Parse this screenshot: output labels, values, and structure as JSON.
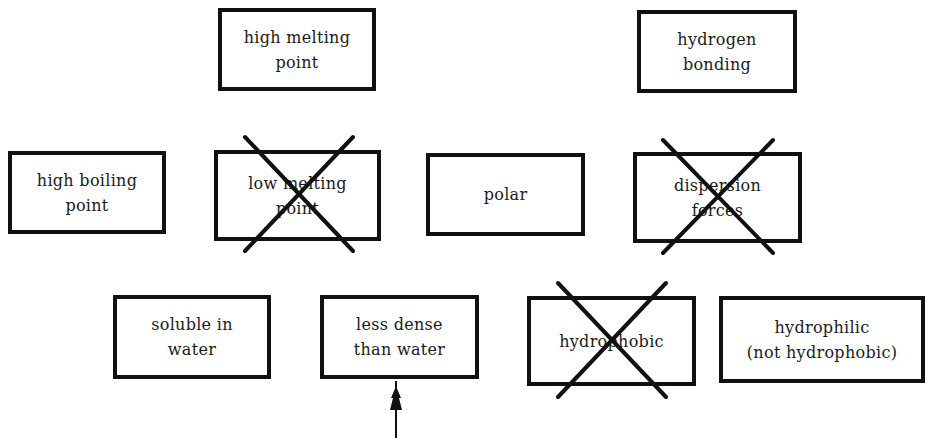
{
  "diagram": {
    "type": "property-card-sort",
    "boxes": [
      {
        "id": "high-melting-point",
        "label": "high melting\npoint",
        "crossed_out": false,
        "x": 218,
        "y": 8,
        "w": 158,
        "h": 83
      },
      {
        "id": "hydrogen-bonding",
        "label": "hydrogen\nbonding",
        "crossed_out": false,
        "x": 637,
        "y": 10,
        "w": 160,
        "h": 83
      },
      {
        "id": "high-boiling-point",
        "label": "high boiling\npoint",
        "crossed_out": false,
        "x": 8,
        "y": 151,
        "w": 158,
        "h": 83
      },
      {
        "id": "low-melting-point",
        "label": "low melting\npoint",
        "crossed_out": true,
        "x": 214,
        "y": 150,
        "w": 167,
        "h": 91
      },
      {
        "id": "polar",
        "label": "polar",
        "crossed_out": false,
        "x": 426,
        "y": 153,
        "w": 159,
        "h": 83
      },
      {
        "id": "dispersion-forces",
        "label": "dispersion\nforces",
        "crossed_out": true,
        "x": 633,
        "y": 152,
        "w": 169,
        "h": 91
      },
      {
        "id": "soluble-in-water",
        "label": "soluble in\nwater",
        "crossed_out": false,
        "x": 113,
        "y": 295,
        "w": 158,
        "h": 84
      },
      {
        "id": "less-dense-than-water",
        "label": "less dense\nthan water",
        "crossed_out": false,
        "x": 320,
        "y": 295,
        "w": 159,
        "h": 84
      },
      {
        "id": "hydrophobic",
        "label": "hydrophobic",
        "crossed_out": true,
        "x": 527,
        "y": 296,
        "w": 169,
        "h": 90
      },
      {
        "id": "hydrophilic",
        "label": "hydrophilic\n(not hydrophobic)",
        "crossed_out": false,
        "x": 719,
        "y": 296,
        "w": 206,
        "h": 87
      }
    ],
    "crosses": [
      {
        "target": "low-melting-point",
        "x1": 245,
        "y1": 137,
        "x2": 353,
        "y2": 251
      },
      {
        "target": "dispersion-forces",
        "x1": 663,
        "y1": 140,
        "x2": 773,
        "y2": 253
      },
      {
        "target": "hydrophobic",
        "x1": 558,
        "y1": 283,
        "x2": 666,
        "y2": 397
      }
    ],
    "arrow": {
      "points_to": "less-dense-than-water",
      "x": 396,
      "y_tip": 381,
      "y_tail": 438
    },
    "colors": {
      "line": "#111111",
      "background": "#ffffff",
      "text": "#1a1a1a"
    }
  }
}
